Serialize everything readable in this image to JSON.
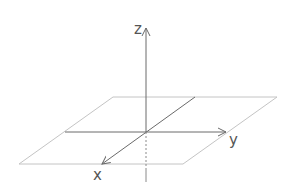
{
  "diagram": {
    "type": "3d-coordinate-axes",
    "colors": {
      "plane": "#c4c4c4",
      "axis": "#6a6a6a",
      "label": "#555555",
      "background": "#ffffff"
    },
    "plane": {
      "points": "113,97 277,97 183,164 19,164"
    },
    "axes": {
      "z": {
        "label": "z",
        "x1": 146,
        "y1": 182,
        "x2": 146,
        "y2": 28,
        "label_x": 134,
        "label_y": 34
      },
      "y": {
        "label": "y",
        "x1": 65,
        "y1": 132,
        "x2": 226,
        "y2": 132,
        "label_x": 229,
        "label_y": 145
      },
      "x": {
        "label": "x",
        "x1": 195,
        "y1": 97,
        "x2": 102,
        "y2": 164,
        "label_x": 93,
        "label_y": 180
      }
    },
    "hidden_segment": {
      "x1": 146,
      "y1": 132,
      "x2": 146,
      "y2": 168,
      "style": "dashed"
    }
  }
}
